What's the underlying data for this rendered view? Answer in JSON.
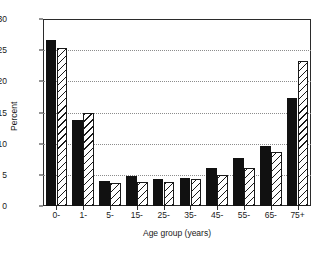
{
  "chart_data": {
    "type": "bar",
    "title": "",
    "subtitle": "",
    "xlabel": "Age group (years)",
    "ylabel": "Percent",
    "categories": [
      "0-",
      "1-",
      "5-",
      "15-",
      "25-",
      "35-",
      "45-",
      "55-",
      "65-",
      "75+"
    ],
    "series": [
      {
        "name": "series-1-solid",
        "fill": "solid-black",
        "color": "#111111",
        "values": [
          26.7,
          13.8,
          4.0,
          4.8,
          4.4,
          4.5,
          6.1,
          7.7,
          9.7,
          17.4
        ]
      },
      {
        "name": "series-2-hatched",
        "fill": "diagonal-hatch",
        "color": "#1a1a1a",
        "values": [
          25.3,
          14.9,
          3.7,
          3.9,
          3.9,
          4.3,
          4.9,
          6.1,
          8.7,
          23.2
        ]
      }
    ],
    "ylim": [
      0,
      30
    ],
    "yticks": [
      0,
      5,
      10,
      15,
      20,
      25,
      30
    ],
    "ytick_labels": [
      "0",
      "5",
      "10",
      "15",
      "20",
      "25",
      "30"
    ],
    "grid": "horizontal-dotted",
    "legend": "none",
    "legend_position": "none",
    "axis_color": "#2b2b2b",
    "grid_color": "#8c8c8c",
    "background": "#ffffff"
  }
}
